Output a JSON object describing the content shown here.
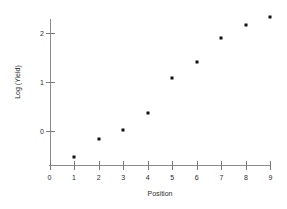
{
  "chart_data": {
    "type": "scatter",
    "title": "",
    "subtitle": "",
    "xlabel": "Position",
    "ylabel": "Log (Yield)",
    "x": [
      1,
      2,
      3,
      4,
      5,
      6,
      7,
      8,
      9
    ],
    "values": [
      -0.53,
      -0.17,
      0.02,
      0.37,
      1.08,
      1.41,
      1.9,
      2.16,
      2.33
    ],
    "series": [
      {
        "name": "Log (Yield) vs Position",
        "points": [
          {
            "x": 1,
            "y": -0.53
          },
          {
            "x": 2,
            "y": -0.17
          },
          {
            "x": 3,
            "y": 0.02
          },
          {
            "x": 4,
            "y": 0.37
          },
          {
            "x": 5,
            "y": 1.08
          },
          {
            "x": 6,
            "y": 1.41
          },
          {
            "x": 7,
            "y": 1.9
          },
          {
            "x": 8,
            "y": 2.16
          },
          {
            "x": 9,
            "y": 2.33
          }
        ]
      }
    ],
    "xticks": [
      0,
      1,
      2,
      3,
      4,
      5,
      6,
      7,
      8,
      9
    ],
    "xtick_labels": [
      "0",
      "1",
      "2",
      "3",
      "4",
      "5",
      "6",
      "7",
      "8",
      "9"
    ],
    "yticks": [
      0,
      1,
      2
    ],
    "ytick_labels": [
      "0",
      "1",
      "2"
    ],
    "xlim": [
      0,
      9.2
    ],
    "ylim": [
      -0.72,
      2.55
    ],
    "grid": false,
    "legend": false,
    "legend_position": "none",
    "marker": "square",
    "marker_color": "#111111",
    "axis_color": "#8c8c8c",
    "background_color": "#ffffff",
    "annotations": []
  }
}
